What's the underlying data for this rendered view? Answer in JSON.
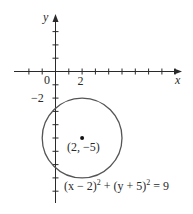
{
  "figure": {
    "axes": {
      "x_label": "x",
      "y_label": "y",
      "origin_label": "0",
      "x_tick_label": "2",
      "y_tick_label": "−2",
      "x_ticks": [
        -2,
        -1,
        0,
        1,
        2,
        3,
        4,
        5,
        6,
        7,
        8,
        9
      ],
      "y_ticks": [
        3,
        2,
        1,
        0,
        -1,
        -2,
        -3,
        -4,
        -5,
        -6,
        -7,
        -8,
        -9
      ]
    },
    "circle": {
      "center": [
        2,
        -5
      ],
      "radius": 3,
      "center_label": "(2, −5)"
    },
    "equation": {
      "part1": "(x − 2)",
      "sup1": "2",
      "part2": " + (y + 5)",
      "sup2": "2",
      "part3": " = 9"
    },
    "colors": {
      "axis": "#2a2a2a",
      "circle": "#555555"
    }
  }
}
